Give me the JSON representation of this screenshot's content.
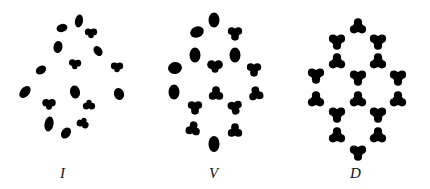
{
  "figure": {
    "ink_color": "#000000",
    "background_color": "#ffffff",
    "panels": [
      {
        "id": "I",
        "label": "I",
        "description": "irregular arrangement of 16 blob-shaped particles",
        "particle_count": 16
      },
      {
        "id": "V",
        "label": "V",
        "description": "partially ordered arrangement of 16 rounded three-lobed particles",
        "particle_count": 16
      },
      {
        "id": "D",
        "label": "D",
        "description": "ordered hexagonal arrangement of 16 three-lobed (trefoil) particles",
        "particle_count": 16
      }
    ]
  }
}
